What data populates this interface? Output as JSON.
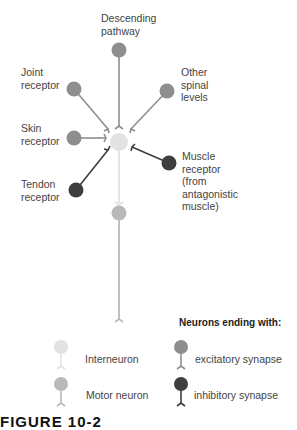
{
  "diagram": {
    "nodes": {
      "descending_pathway": {
        "label_line1": "Descending",
        "label_line2": "pathway",
        "type": "excitatory"
      },
      "joint_receptor": {
        "label_line1": "Joint",
        "label_line2": "receptor",
        "type": "excitatory"
      },
      "other_spinal_levels": {
        "label_line1": "Other",
        "label_line2": "spinal",
        "label_line3": "levels",
        "type": "excitatory"
      },
      "skin_receptor": {
        "label_line1": "Skin",
        "label_line2": "receptor",
        "type": "excitatory"
      },
      "tendon_receptor": {
        "label_line1": "Tendon",
        "label_line2": "receptor",
        "type": "inhibitory"
      },
      "muscle_receptor": {
        "label_line1": "Muscle",
        "label_line2": "receptor",
        "label_line3": "(from",
        "label_line4": "antagonistic",
        "label_line5": "muscle)",
        "type": "inhibitory"
      },
      "interneuron": {
        "type": "interneuron"
      },
      "motor_neuron": {
        "type": "motor"
      }
    }
  },
  "legend": {
    "title": "Neurons ending with:",
    "interneuron": "Interneuron",
    "motor_neuron": "Motor neuron",
    "excitatory": "excitatory synapse",
    "inhibitory": "inhibitory synapse"
  },
  "caption": "FIGURE 10-2",
  "colors": {
    "interneuron": "#e2e2e2",
    "motor_neuron": "#b9b9b9",
    "excitatory": "#8e8e8e",
    "inhibitory": "#3e3e3e"
  }
}
